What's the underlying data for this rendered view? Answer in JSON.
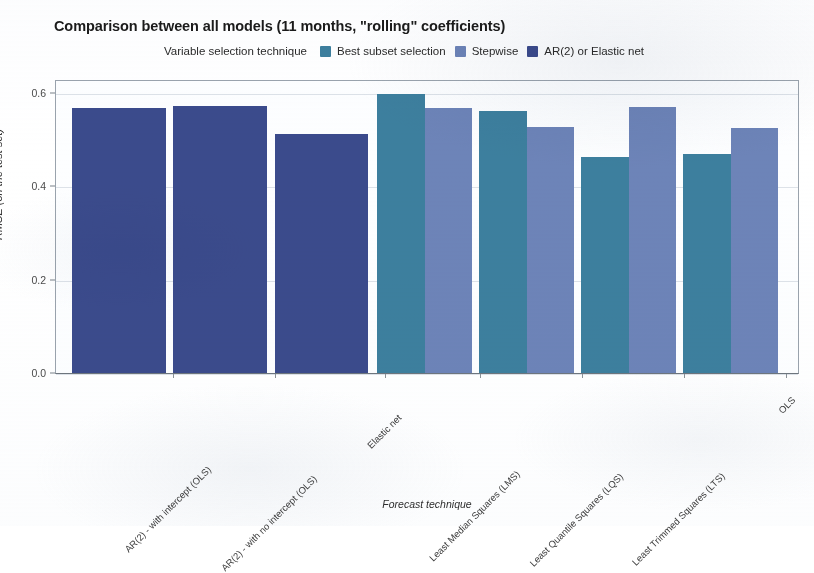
{
  "title": "Comparison between all models (11 months, \"rolling\" coefficients)",
  "legend": {
    "title": "Variable selection technique",
    "entries": [
      {
        "label": "Best subset selection",
        "color": "#3d7f9e"
      },
      {
        "label": "Stepwise",
        "color": "#6d84b8"
      },
      {
        "label": "AR(2) or Elastic net",
        "color": "#3b4b8c"
      }
    ]
  },
  "axes": {
    "ylabel": "RMSE (on the test set)",
    "xlabel": "Forecast technique",
    "yticks": [
      "0.0",
      "0.2",
      "0.4",
      "0.6"
    ],
    "ytick_values": [
      0.0,
      0.2,
      0.4,
      0.6
    ]
  },
  "chart_data": {
    "type": "bar",
    "title": "Comparison between all models (11 months, \"rolling\" coefficients)",
    "xlabel": "Forecast technique",
    "ylabel": "RMSE (on the test set)",
    "ylim": [
      0.0,
      0.62
    ],
    "yticks": [
      0.0,
      0.2,
      0.4,
      0.6
    ],
    "grid": true,
    "legend_position": "top",
    "legend_title": "Variable selection technique",
    "categories": [
      "AR(2) - with intercept (OLS)",
      "AR(2) - with no intercept (OLS)",
      "Elastic net",
      "Least Median Squares (LMS)",
      "Least Quantile Squares (LQS)",
      "Least Trimmed Squares (LTS)",
      "OLS"
    ],
    "series": [
      {
        "name": "Best subset selection",
        "color": "#3d7f9e",
        "values": [
          null,
          null,
          null,
          0.595,
          0.56,
          0.46,
          0.468
        ]
      },
      {
        "name": "Stepwise",
        "color": "#6d84b8",
        "values": [
          null,
          null,
          null,
          0.565,
          0.525,
          0.567,
          0.522
        ]
      },
      {
        "name": "AR(2) or Elastic net",
        "color": "#3b4b8c",
        "values": [
          0.565,
          0.57,
          0.51,
          null,
          null,
          null,
          null
        ]
      }
    ],
    "bars": [
      {
        "category": "AR(2) - with intercept (OLS)",
        "series": "AR(2) or Elastic net",
        "value": 0.565,
        "color": "#3b4b8c",
        "x": 71,
        "width": 94
      },
      {
        "category": "AR(2) - with no intercept (OLS)",
        "series": "AR(2) or Elastic net",
        "value": 0.57,
        "color": "#3b4b8c",
        "x": 172,
        "width": 94
      },
      {
        "category": "Elastic net",
        "series": "AR(2) or Elastic net",
        "value": 0.51,
        "color": "#3b4b8c",
        "x": 274,
        "width": 93
      },
      {
        "category": "Least Median Squares (LMS)",
        "series": "Best subset selection",
        "value": 0.595,
        "color": "#3d7f9e",
        "x": 376,
        "width": 48
      },
      {
        "category": "Least Median Squares (LMS)",
        "series": "Stepwise",
        "value": 0.565,
        "color": "#6d84b8",
        "x": 424,
        "width": 47
      },
      {
        "category": "Least Quantile Squares (LQS)",
        "series": "Best subset selection",
        "value": 0.56,
        "color": "#3d7f9e",
        "x": 478,
        "width": 48
      },
      {
        "category": "Least Quantile Squares (LQS)",
        "series": "Stepwise",
        "value": 0.525,
        "color": "#6d84b8",
        "x": 526,
        "width": 47
      },
      {
        "category": "Least Trimmed Squares (LTS)",
        "series": "Best subset selection",
        "value": 0.46,
        "color": "#3d7f9e",
        "x": 580,
        "width": 48
      },
      {
        "category": "Least Trimmed Squares (LTS)",
        "series": "Stepwise",
        "value": 0.567,
        "color": "#6d84b8",
        "x": 628,
        "width": 47
      },
      {
        "category": "OLS",
        "series": "Best subset selection",
        "value": 0.468,
        "color": "#3d7f9e",
        "x": 682,
        "width": 48
      },
      {
        "category": "OLS",
        "series": "Stepwise",
        "value": 0.522,
        "color": "#6d84b8",
        "x": 730,
        "width": 47
      }
    ],
    "tick_positions": [
      173,
      275,
      385,
      480,
      582,
      684,
      786
    ]
  }
}
